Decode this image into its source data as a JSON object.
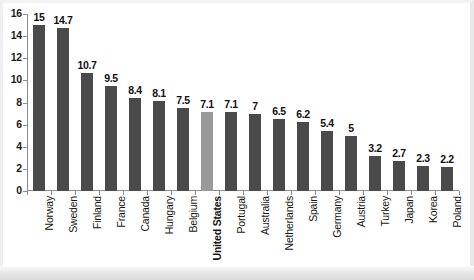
{
  "chart_data": {
    "type": "bar",
    "title": "",
    "subtitle": "",
    "xlabel": "",
    "ylabel": "",
    "ylim": [
      0,
      16
    ],
    "ytick_step": 2,
    "yticks": [
      "16",
      "14",
      "12",
      "10",
      "8",
      "6",
      "4",
      "2",
      "0"
    ],
    "grid": false,
    "legend": "none",
    "categories": [
      "Norway",
      "Sweden",
      "Finland",
      "France",
      "Canada",
      "Hungary",
      "Belgium",
      "United States",
      "Portugal",
      "Australia",
      "Netherlands",
      "Spain",
      "Germany",
      "Austria",
      "Turkey",
      "Japan",
      "Korea",
      "Poland"
    ],
    "values": [
      15,
      14.7,
      10.7,
      9.5,
      8.4,
      8.1,
      7.5,
      7.1,
      7.1,
      7,
      6.5,
      6.2,
      5.4,
      5,
      3.2,
      2.7,
      2.3,
      2.2
    ],
    "value_labels": [
      "15",
      "14.7",
      "10.7",
      "9.5",
      "8.4",
      "8.1",
      "7.5",
      "7.1",
      "7.1",
      "7",
      "6.5",
      "6.2",
      "5.4",
      "5",
      "3.2",
      "2.7",
      "2.3",
      "2.2"
    ],
    "highlight_index": 7,
    "highlight_category": "United States",
    "colors": {
      "bar": "#4a4a4a",
      "bar_highlight": "#9a9a9a",
      "axis": "#8c8c8c",
      "text": "#111111",
      "background": "#ffffff"
    }
  }
}
